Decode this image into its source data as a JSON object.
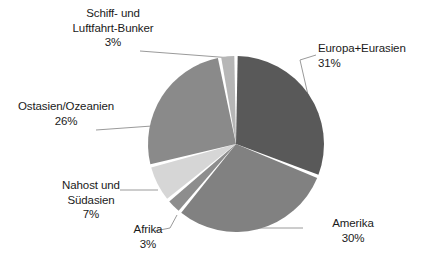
{
  "chart_data": {
    "type": "pie",
    "title": "",
    "subtitle": "",
    "xlabel": "",
    "ylabel": "",
    "legend_position": "none",
    "grid": false,
    "labels_show_percent": true,
    "categories": [
      "Europa+Eurasien",
      "Amerika",
      "Afrika",
      "Nahost und Südasien",
      "Ostasien/Ozeanien",
      "Schiff- und Luftfahrt-Bunker"
    ],
    "values": [
      31,
      30,
      3,
      7,
      26,
      3
    ],
    "unit": "%",
    "slices": [
      {
        "name": "Europa+Eurasien",
        "value": 31,
        "value_label": "31%",
        "color": "#595959",
        "label_lines": [
          "Europa+Eurasien",
          "31%"
        ]
      },
      {
        "name": "Amerika",
        "value": 30,
        "value_label": "30%",
        "color": "#818181",
        "label_lines": [
          "Amerika",
          "30%"
        ]
      },
      {
        "name": "Afrika",
        "value": 3,
        "value_label": "3%",
        "color": "#8d8d8d",
        "label_lines": [
          "Afrika",
          "3%"
        ]
      },
      {
        "name": "Nahost und Südasien",
        "value": 7,
        "value_label": "7%",
        "color": "#d6d6d6",
        "label_lines": [
          "Nahost und",
          "Südasien",
          "7%"
        ]
      },
      {
        "name": "Ostasien/Ozeanien",
        "value": 26,
        "value_label": "26%",
        "color": "#8a8a8a",
        "label_lines": [
          "Ostasien/Ozeanien",
          "26%"
        ]
      },
      {
        "name": "Schiff- und Luftfahrt-Bunker",
        "value": 3,
        "value_label": "3%",
        "color": "#b6b6b6",
        "label_lines": [
          "Schiff- und",
          "Luftfahrt-Bunker",
          "3%"
        ]
      }
    ]
  },
  "labels": {
    "schiff": {
      "line1": "Schiff- und",
      "line2": "Luftfahrt-Bunker",
      "line3": "3%"
    },
    "europa": {
      "line1": "Europa+Eurasien",
      "line2": "31%"
    },
    "ostasien": {
      "line1": "Ostasien/Ozeanien",
      "line2": "26%"
    },
    "nahost": {
      "line1": "Nahost und",
      "line2": "Südasien",
      "line3": "7%"
    },
    "afrika": {
      "line1": "Afrika",
      "line2": "3%"
    },
    "amerika": {
      "line1": "Amerika",
      "line2": "30%"
    }
  },
  "style": {
    "background": "#ffffff",
    "text_color": "#1a1a1a",
    "leader_line_color": "#9a9a9a",
    "slice_gap_color": "#ffffff"
  }
}
